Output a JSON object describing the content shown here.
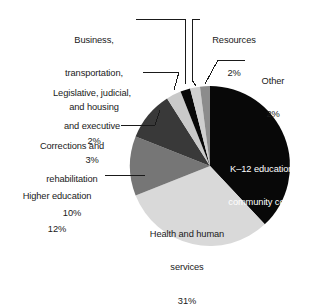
{
  "chart_data": {
    "type": "pie",
    "title": "",
    "subtitle": "",
    "xlabel": "",
    "ylabel": "",
    "legend_position": "none",
    "grid": false,
    "units": "percent",
    "start_angle_deg": 0,
    "direction": "clockwise",
    "categories": [
      "K–12 education & community college",
      "Health and human services",
      "Higher education",
      "Corrections and rehabilitation",
      "Legislative, judicial, and executive",
      "Business, transportation, and housing",
      "Resources",
      "Other"
    ],
    "values": [
      38,
      31,
      12,
      10,
      3,
      2,
      2,
      2
    ],
    "value_labels": [
      "38%",
      "31%",
      "12%",
      "10%",
      "3%",
      "2%",
      "2%",
      "2%"
    ],
    "colors": [
      "#080808",
      "#d9d9d9",
      "#767676",
      "#393939",
      "#c9c9c9",
      "#080808",
      "#cfcfcf",
      "#8c8c8c"
    ],
    "slices": [
      {
        "name": "K–12 education & community college",
        "value": 38,
        "value_label": "38%",
        "color": "#080808",
        "label_placement": "inside",
        "label_lines": [
          "K–12 education &",
          "community college",
          "38%"
        ]
      },
      {
        "name": "Health and human services",
        "value": 31,
        "value_label": "31%",
        "color": "#d9d9d9",
        "label_placement": "inside",
        "label_lines": [
          "Health and human",
          "services",
          "31%"
        ]
      },
      {
        "name": "Higher education",
        "value": 12,
        "value_label": "12%",
        "color": "#767676",
        "label_placement": "callout",
        "label_lines": [
          "Higher education",
          "12%"
        ]
      },
      {
        "name": "Corrections and rehabilitation",
        "value": 10,
        "value_label": "10%",
        "color": "#393939",
        "label_placement": "callout",
        "label_lines": [
          "Corrections and",
          "rehabilitation",
          "10%"
        ]
      },
      {
        "name": "Legislative, judicial, and executive",
        "value": 3,
        "value_label": "3%",
        "color": "#c9c9c9",
        "label_placement": "callout",
        "label_lines": [
          "Legislative, judicial,",
          "and executive",
          "3%"
        ]
      },
      {
        "name": "Business, transportation, and housing",
        "value": 2,
        "value_label": "2%",
        "color": "#080808",
        "label_placement": "callout",
        "label_lines": [
          "Business,",
          "transportation,",
          "and housing",
          "2%"
        ]
      },
      {
        "name": "Resources",
        "value": 2,
        "value_label": "2%",
        "color": "#cfcfcf",
        "label_placement": "callout",
        "label_lines": [
          "Resources",
          "2%"
        ]
      },
      {
        "name": "Other",
        "value": 2,
        "value_label": "2%",
        "color": "#8c8c8c",
        "label_placement": "callout",
        "label_lines": [
          "Other",
          "2%"
        ]
      }
    ]
  },
  "callouts": {
    "business": {
      "line1": "Business,",
      "line2": "transportation,",
      "line3": "and housing",
      "line4": "2%"
    },
    "resources": {
      "line1": "Resources",
      "line2": "2%"
    },
    "other": {
      "line1": "Other",
      "line2": "2%"
    },
    "legislative": {
      "line1": "Legislative, judicial,",
      "line2": "and executive",
      "line3": "3%"
    },
    "corrections": {
      "line1": "Corrections and",
      "line2": "rehabilitation",
      "line3": "10%"
    },
    "higher_education": {
      "line1": "Higher education",
      "line2": "12%"
    }
  },
  "inside_labels": {
    "k12": {
      "line1": "K–12 education &",
      "line2": "community college",
      "line3": "38%"
    },
    "health": {
      "line1": "Health and human",
      "line2": "services",
      "line3": "31%"
    }
  },
  "style": {
    "background": "#ffffff",
    "leader_line_color": "#1a1a1a",
    "text_color": "#1a1a1a",
    "inverse_text_color": "#ffffff"
  }
}
